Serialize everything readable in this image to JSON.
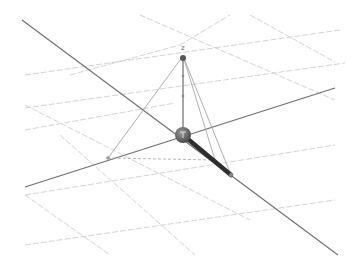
{
  "scene": {
    "background": "#ffffff",
    "axis_labels": {
      "z": "z"
    },
    "colors": {
      "grid": "#c8c8c8",
      "axis": "#6e6e6e",
      "rod": "#2e2e2e",
      "sphere": "#4a4a4a",
      "pyramid": "#9a9a9a"
    },
    "grid_lines": [
      {
        "x1": 70,
        "y1": 75,
        "x2": 180,
        "y2": 45
      },
      {
        "x1": 180,
        "y1": 45,
        "x2": 230,
        "y2": 15
      },
      {
        "x1": 25,
        "y1": 75,
        "x2": 340,
        "y2": 30
      },
      {
        "x1": 25,
        "y1": 108,
        "x2": 345,
        "y2": 63
      },
      {
        "x1": 25,
        "y1": 130,
        "x2": 175,
        "y2": 103
      },
      {
        "x1": 25,
        "y1": 195,
        "x2": 335,
        "y2": 145
      },
      {
        "x1": 25,
        "y1": 245,
        "x2": 335,
        "y2": 200
      },
      {
        "x1": 140,
        "y1": 15,
        "x2": 335,
        "y2": 100
      },
      {
        "x1": 25,
        "y1": 105,
        "x2": 250,
        "y2": 220
      },
      {
        "x1": 25,
        "y1": 195,
        "x2": 110,
        "y2": 255
      },
      {
        "x1": 60,
        "y1": 135,
        "x2": 195,
        "y2": 255
      },
      {
        "x1": 250,
        "y1": 15,
        "x2": 335,
        "y2": 62
      }
    ],
    "axes": [
      {
        "name": "axis-diagonal",
        "x1": 22,
        "y1": 20,
        "x2": 338,
        "y2": 255
      },
      {
        "name": "axis-horizontal",
        "x1": 25,
        "y1": 187,
        "x2": 335,
        "y2": 88
      }
    ],
    "origin": {
      "x": 183,
      "y": 135,
      "r": 8
    },
    "z_point": {
      "x": 183,
      "y": 56
    },
    "z_label_pos": {
      "x": 181,
      "y": 50
    },
    "rod": {
      "x1": 183,
      "y1": 135,
      "x2": 231,
      "y2": 175
    },
    "pyramid_base": [
      {
        "x": 108,
        "y": 158
      },
      {
        "x": 183,
        "y": 135
      },
      {
        "x": 231,
        "y": 175
      },
      {
        "x": 215,
        "y": 160
      }
    ]
  }
}
